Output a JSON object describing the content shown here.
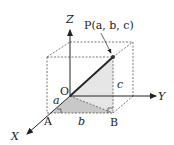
{
  "diagram": {
    "axes": {
      "x_label": "X",
      "y_label": "Y",
      "z_label": "Z",
      "origin_label": "O"
    },
    "point": {
      "label": "P(a, b, c)"
    },
    "points": {
      "A": "A",
      "B": "B"
    },
    "lengths": {
      "a": "a",
      "b": "b",
      "c": "c"
    },
    "colors": {
      "line": "#222222",
      "dashed": "#555555",
      "shade_dark": "#c8c8c8",
      "shade_light": "#e4e4e4"
    }
  }
}
